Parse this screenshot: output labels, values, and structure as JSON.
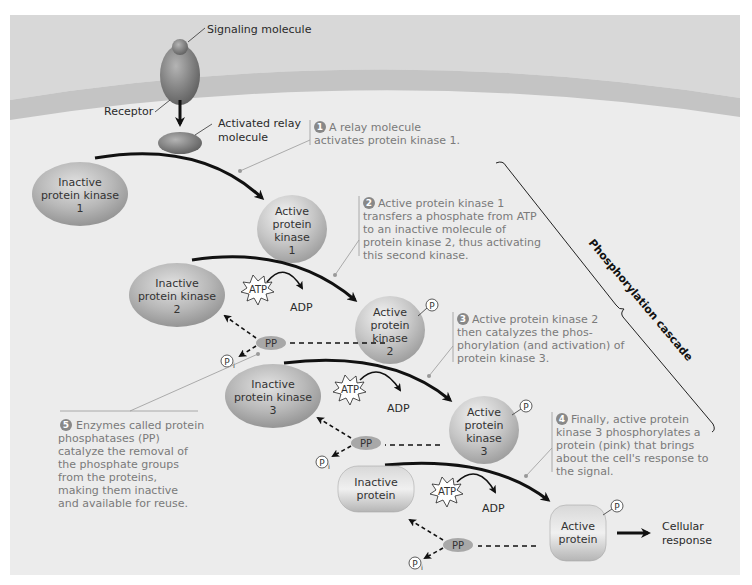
{
  "diagram": {
    "title": "Phosphorylation cascade",
    "colors": {
      "background": "#ececec",
      "extracellular": "#d6d6d6",
      "membrane": "#c4c4c4",
      "molecule_dark": "#7d7d7d",
      "molecule_light": "#c9c9c9",
      "note_text": "#7a7a7a",
      "arrow": "#111111"
    },
    "labels": {
      "signaling_molecule": "Signaling molecule",
      "receptor": "Receptor",
      "relay_line1": "Activated relay",
      "relay_line2": "molecule",
      "atp": "ATP",
      "adp": "ADP",
      "pp": "PP",
      "p": "P",
      "pi_sub": "i",
      "cellular_line1": "Cellular",
      "cellular_line2": "response"
    },
    "molecules": {
      "inactive_k1": [
        "Inactive",
        "protein kinase",
        "1"
      ],
      "active_k1": [
        "Active",
        "protein",
        "kinase",
        "1"
      ],
      "inactive_k2": [
        "Inactive",
        "protein kinase",
        "2"
      ],
      "active_k2": [
        "Active",
        "protein",
        "kinase",
        "2"
      ],
      "inactive_k3": [
        "Inactive",
        "protein kinase",
        "3"
      ],
      "active_k3": [
        "Active",
        "protein",
        "kinase",
        "3"
      ],
      "inactive_protein": [
        "Inactive",
        "protein"
      ],
      "active_protein": [
        "Active",
        "protein"
      ]
    },
    "steps": [
      {
        "number": "1",
        "lines": [
          "A relay molecule",
          "activates protein kinase 1."
        ]
      },
      {
        "number": "2",
        "lines": [
          "Active protein kinase 1",
          "transfers a phosphate from ATP",
          "to an inactive molecule of",
          "protein kinase 2, thus activating",
          "this second kinase."
        ]
      },
      {
        "number": "3",
        "lines": [
          "Active protein kinase 2",
          "then catalyzes the phos-",
          "phorylation (and activation) of",
          "protein kinase 3."
        ]
      },
      {
        "number": "4",
        "lines": [
          "Finally, active protein",
          "kinase 3 phosphorylates a",
          "protein (pink) that brings",
          "about the cell's response to",
          "the signal."
        ]
      },
      {
        "number": "5",
        "lines": [
          "Enzymes called protein",
          "phosphatases (PP)",
          "catalyze the removal of",
          "the phosphate groups",
          "from the proteins,",
          "making them inactive",
          "and available for reuse."
        ]
      }
    ]
  }
}
